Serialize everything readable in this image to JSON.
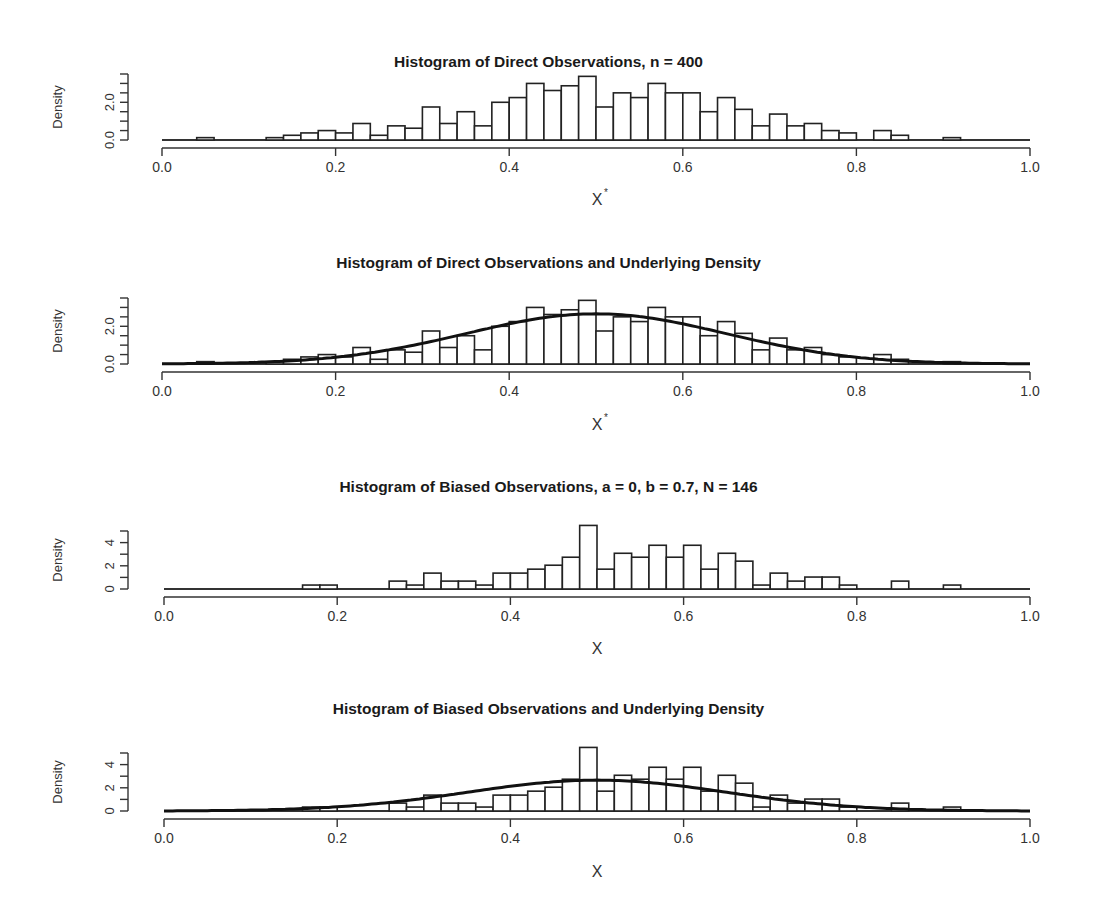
{
  "chart_data": [
    {
      "type": "bar",
      "title": "Histogram of Direct Observations,  n =  400",
      "xlabel": "X*",
      "ylabel": "Density",
      "xlim": [
        0,
        1
      ],
      "ylim": [
        0,
        3.5
      ],
      "yticks": [
        0,
        0.5,
        1.0,
        1.5,
        2.0,
        2.5,
        3.0,
        3.5
      ],
      "ytick_labels": [
        "0.0",
        "",
        "",
        "",
        "2.0",
        "",
        "",
        ""
      ],
      "xticks": [
        0.0,
        0.2,
        0.4,
        0.6,
        0.8,
        1.0
      ],
      "xtick_labels": [
        "0.0",
        "0.2",
        "0.4",
        "0.6",
        "0.8",
        "1.0"
      ],
      "bin_width": 0.02,
      "bin_starts": [
        0.04,
        0.06,
        0.08,
        0.1,
        0.12,
        0.14,
        0.16,
        0.18,
        0.2,
        0.22,
        0.24,
        0.26,
        0.28,
        0.3,
        0.32,
        0.34,
        0.36,
        0.38,
        0.4,
        0.42,
        0.44,
        0.46,
        0.48,
        0.5,
        0.52,
        0.54,
        0.56,
        0.58,
        0.6,
        0.62,
        0.64,
        0.66,
        0.68,
        0.7,
        0.72,
        0.74,
        0.76,
        0.78,
        0.8,
        0.82,
        0.84,
        0.86,
        0.88,
        0.9
      ],
      "values": [
        0.125,
        0,
        0,
        0,
        0.125,
        0.25,
        0.375,
        0.5,
        0.375,
        0.875,
        0.25,
        0.75,
        0.625,
        1.75,
        0.875,
        1.5,
        0.75,
        2.0,
        2.25,
        3.0,
        2.625,
        2.875,
        3.375,
        1.75,
        2.5,
        2.25,
        3.0,
        2.5,
        2.5,
        1.5,
        2.25,
        1.625,
        0.75,
        1.375,
        0.75,
        0.875,
        0.5,
        0.375,
        0,
        0.5,
        0.25,
        0,
        0,
        0.125
      ],
      "density_curve": false,
      "grid": false
    },
    {
      "type": "bar",
      "title": "Histogram of Direct Observations and Underlying Density",
      "xlabel": "X*",
      "ylabel": "Density",
      "xlim": [
        0,
        1
      ],
      "ylim": [
        0,
        3.5
      ],
      "yticks": [
        0,
        0.5,
        1.0,
        1.5,
        2.0,
        2.5,
        3.0,
        3.5
      ],
      "ytick_labels": [
        "0.0",
        "",
        "",
        "",
        "2.0",
        "",
        "",
        ""
      ],
      "xticks": [
        0.0,
        0.2,
        0.4,
        0.6,
        0.8,
        1.0
      ],
      "xtick_labels": [
        "0.0",
        "0.2",
        "0.4",
        "0.6",
        "0.8",
        "1.0"
      ],
      "bin_width": 0.02,
      "bin_starts": [
        0.04,
        0.06,
        0.08,
        0.1,
        0.12,
        0.14,
        0.16,
        0.18,
        0.2,
        0.22,
        0.24,
        0.26,
        0.28,
        0.3,
        0.32,
        0.34,
        0.36,
        0.38,
        0.4,
        0.42,
        0.44,
        0.46,
        0.48,
        0.5,
        0.52,
        0.54,
        0.56,
        0.58,
        0.6,
        0.62,
        0.64,
        0.66,
        0.68,
        0.7,
        0.72,
        0.74,
        0.76,
        0.78,
        0.8,
        0.82,
        0.84,
        0.86,
        0.88,
        0.9
      ],
      "values": [
        0.125,
        0,
        0,
        0,
        0.125,
        0.25,
        0.375,
        0.5,
        0.375,
        0.875,
        0.25,
        0.75,
        0.625,
        1.75,
        0.875,
        1.5,
        0.75,
        2.0,
        2.25,
        3.0,
        2.625,
        2.875,
        3.375,
        1.75,
        2.5,
        2.25,
        3.0,
        2.5,
        2.5,
        1.5,
        2.25,
        1.625,
        0.75,
        1.375,
        0.75,
        0.875,
        0.5,
        0.375,
        0,
        0.5,
        0.25,
        0,
        0,
        0.125
      ],
      "density_curve": {
        "mean": 0.5,
        "sd": 0.15,
        "peak": 2.66
      },
      "grid": false
    },
    {
      "type": "bar",
      "title": "Histogram of Biased Observations,  a =  0,  b =  0.7,  N =  146",
      "xlabel": "X",
      "ylabel": "Density",
      "xlim": [
        0,
        1
      ],
      "ylim": [
        0,
        5
      ],
      "yticks": [
        0,
        1,
        2,
        3,
        4,
        5
      ],
      "ytick_labels": [
        "0",
        "",
        "2",
        "",
        "4",
        ""
      ],
      "xticks": [
        0.0,
        0.2,
        0.4,
        0.6,
        0.8,
        1.0
      ],
      "xtick_labels": [
        "0.0",
        "0.2",
        "0.4",
        "0.6",
        "0.8",
        "1.0"
      ],
      "bin_width": 0.02,
      "bin_starts": [
        0.16,
        0.18,
        0.2,
        0.22,
        0.24,
        0.26,
        0.28,
        0.3,
        0.32,
        0.34,
        0.36,
        0.38,
        0.4,
        0.42,
        0.44,
        0.46,
        0.48,
        0.5,
        0.52,
        0.54,
        0.56,
        0.58,
        0.6,
        0.62,
        0.64,
        0.66,
        0.68,
        0.7,
        0.72,
        0.74,
        0.76,
        0.78,
        0.8,
        0.82,
        0.84,
        0.86,
        0.88,
        0.9
      ],
      "values": [
        0.34,
        0.34,
        0,
        0,
        0,
        0.68,
        0.34,
        1.37,
        0.68,
        0.68,
        0.34,
        1.37,
        1.37,
        1.71,
        2.05,
        2.74,
        5.48,
        1.71,
        3.08,
        2.74,
        3.77,
        2.74,
        3.77,
        1.71,
        3.08,
        2.4,
        0.34,
        1.37,
        0.68,
        1.03,
        1.03,
        0.34,
        0,
        0,
        0.68,
        0,
        0,
        0.34
      ],
      "density_curve": false,
      "grid": false
    },
    {
      "type": "bar",
      "title": "Histogram of Biased Observations and Underlying Density",
      "xlabel": "X",
      "ylabel": "Density",
      "xlim": [
        0,
        1
      ],
      "ylim": [
        0,
        5
      ],
      "yticks": [
        0,
        1,
        2,
        3,
        4,
        5
      ],
      "ytick_labels": [
        "0",
        "",
        "2",
        "",
        "4",
        ""
      ],
      "xticks": [
        0.0,
        0.2,
        0.4,
        0.6,
        0.8,
        1.0
      ],
      "xtick_labels": [
        "0.0",
        "0.2",
        "0.4",
        "0.6",
        "0.8",
        "1.0"
      ],
      "bin_width": 0.02,
      "bin_starts": [
        0.16,
        0.18,
        0.2,
        0.22,
        0.24,
        0.26,
        0.28,
        0.3,
        0.32,
        0.34,
        0.36,
        0.38,
        0.4,
        0.42,
        0.44,
        0.46,
        0.48,
        0.5,
        0.52,
        0.54,
        0.56,
        0.58,
        0.6,
        0.62,
        0.64,
        0.66,
        0.68,
        0.7,
        0.72,
        0.74,
        0.76,
        0.78,
        0.8,
        0.82,
        0.84,
        0.86,
        0.88,
        0.9
      ],
      "values": [
        0.34,
        0.34,
        0,
        0,
        0,
        0.68,
        0.34,
        1.37,
        0.68,
        0.68,
        0.34,
        1.37,
        1.37,
        1.71,
        2.05,
        2.74,
        5.48,
        1.71,
        3.08,
        2.74,
        3.77,
        2.74,
        3.77,
        1.71,
        3.08,
        2.4,
        0.34,
        1.37,
        0.68,
        1.03,
        1.03,
        0.34,
        0,
        0,
        0.68,
        0,
        0,
        0.34
      ],
      "density_curve": {
        "mean": 0.5,
        "sd": 0.15,
        "peak": 2.66
      },
      "grid": false
    }
  ],
  "panels": [
    {
      "title": "Histogram of Direct Observations,  n =  400",
      "xlabel": "X",
      "xlabel_sup": "*",
      "ylabel": "Density"
    },
    {
      "title": "Histogram of Direct Observations and Underlying Density",
      "xlabel": "X",
      "xlabel_sup": "*",
      "ylabel": "Density"
    },
    {
      "title": "Histogram of Biased Observations,  a =  0,  b =  0.7,  N =  146",
      "xlabel": "X",
      "xlabel_sup": "",
      "ylabel": "Density"
    },
    {
      "title": "Histogram of Biased Observations and Underlying Density",
      "xlabel": "X",
      "xlabel_sup": "",
      "ylabel": "Density"
    }
  ]
}
